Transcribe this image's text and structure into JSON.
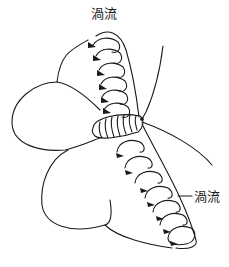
{
  "diagram": {
    "type": "wing-vortex-illustration",
    "labels": {
      "top": "渦流",
      "right": "渦流"
    },
    "caption_visible": "cut-off (only top edge of caption glyphs visible)",
    "colors": {
      "stroke": "#1a1a1a",
      "background": "#ffffff"
    },
    "elements": {
      "upper_vortices": 6,
      "lower_vortices": 7,
      "body_stripes": 7
    }
  }
}
